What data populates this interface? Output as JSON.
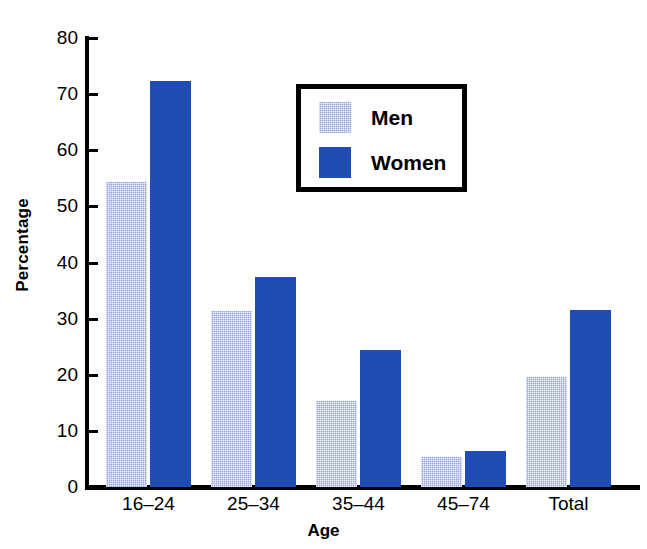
{
  "chart_data": {
    "type": "bar",
    "title": "",
    "xlabel": "Age",
    "ylabel": "Percentage",
    "categories": [
      "16–24",
      "25–34",
      "35–44",
      "45–74",
      "Total"
    ],
    "series": [
      {
        "name": "Men",
        "values": [
          54.4,
          31.4,
          15.4,
          5.4,
          19.6
        ],
        "color": "#8fa0dd",
        "fill": "dotted"
      },
      {
        "name": "Women",
        "values": [
          72.3,
          37.5,
          24.5,
          6.4,
          31.6
        ],
        "color": "#1f4db5",
        "fill": "solid"
      }
    ],
    "ylim": [
      0,
      80
    ],
    "ytick_values": [
      0,
      10,
      20,
      30,
      40,
      50,
      60,
      70,
      80
    ],
    "ytick_labels": [
      "0",
      "10",
      "20",
      "30",
      "40",
      "50",
      "60",
      "70",
      "80"
    ],
    "grid": false,
    "legend_position": "upper-center",
    "legend_entries": [
      "Men",
      "Women"
    ]
  },
  "axes": {
    "y_title": "Percentage",
    "x_title": "Age"
  },
  "legend": {
    "items": [
      {
        "label": "Men"
      },
      {
        "label": "Women"
      }
    ]
  }
}
